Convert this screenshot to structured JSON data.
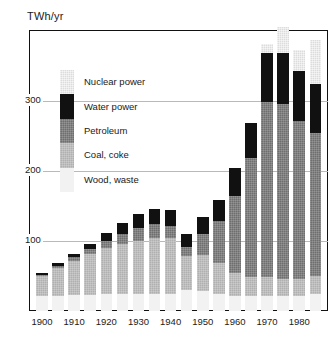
{
  "chart_data": {
    "type": "bar",
    "title": "",
    "ylabel": "TWh/yr",
    "xlabel": "",
    "ylim": [
      0,
      400
    ],
    "grid": true,
    "stacked": true,
    "legend_position": "inside-upper-left",
    "ytick_labels": [
      "100",
      "200",
      "300"
    ],
    "ytick_values": [
      100,
      200,
      300
    ],
    "xtick_labels": [
      "1900",
      "1910",
      "1920",
      "1930",
      "1940",
      "1950",
      "1960",
      "1970",
      "1980"
    ],
    "xtick_values": [
      1900,
      1910,
      1920,
      1930,
      1940,
      1950,
      1960,
      1970,
      1980
    ],
    "categories": [
      1900,
      1905,
      1910,
      1915,
      1920,
      1925,
      1930,
      1935,
      1940,
      1945,
      1950,
      1955,
      1960,
      1965,
      1970,
      1975,
      1980,
      1985
    ],
    "series": [
      {
        "name": "Wood, waste",
        "color": "#f2f2f2",
        "values": [
          22,
          22,
          23,
          23,
          24,
          24,
          24,
          24,
          24,
          30,
          28,
          24,
          22,
          22,
          22,
          22,
          22,
          24
        ]
      },
      {
        "name": "Coal, coke",
        "color": "#b0b0b0",
        "values": [
          28,
          40,
          49,
          58,
          66,
          72,
          76,
          80,
          80,
          48,
          52,
          44,
          32,
          26,
          26,
          24,
          24,
          26
        ]
      },
      {
        "name": "Petroleum",
        "color": "#6e6e6e",
        "values": [
          2,
          3,
          5,
          7,
          10,
          14,
          18,
          20,
          18,
          14,
          30,
          60,
          110,
          170,
          250,
          250,
          225,
          205
        ]
      },
      {
        "name": "Water power",
        "color": "#111111",
        "values": [
          2,
          3,
          5,
          8,
          12,
          16,
          20,
          22,
          22,
          18,
          25,
          30,
          40,
          50,
          70,
          72,
          72,
          70
        ]
      },
      {
        "name": "Nuclear power",
        "color": "#dcdcdc",
        "values": [
          0,
          0,
          0,
          0,
          0,
          0,
          0,
          0,
          0,
          0,
          0,
          0,
          0,
          0,
          14,
          38,
          30,
          62
        ]
      }
    ]
  },
  "legend": {
    "items": [
      {
        "label": "Nuclear power",
        "color": "#dcdcdc"
      },
      {
        "label": "Water power",
        "color": "#111111"
      },
      {
        "label": "Petroleum",
        "color": "#6e6e6e"
      },
      {
        "label": "Coal, coke",
        "color": "#b0b0b0"
      },
      {
        "label": "Wood, waste",
        "color": "#f2f2f2"
      }
    ]
  }
}
